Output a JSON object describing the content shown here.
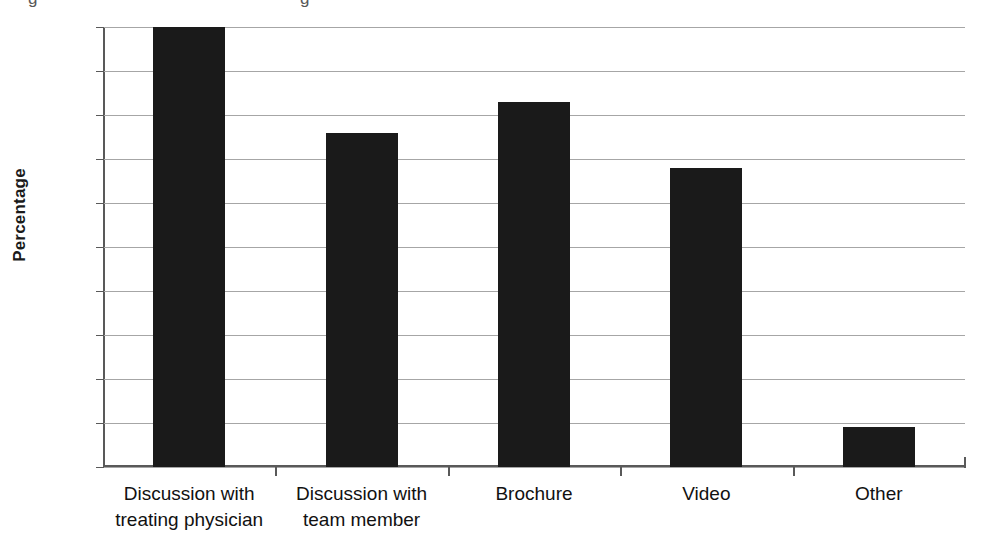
{
  "chart_data": {
    "type": "bar",
    "title": "",
    "xlabel": "",
    "ylabel": "Percentage",
    "categories": [
      "Discussion with treating physician",
      "Discussion with team member",
      "Brochure",
      "Video",
      "Other"
    ],
    "category_lines": [
      [
        "Discussion with",
        "treating physician"
      ],
      [
        "Discussion with",
        "team member"
      ],
      [
        "Brochure"
      ],
      [
        "Video"
      ],
      [
        "Other"
      ]
    ],
    "values": [
      100,
      76,
      83,
      68,
      9
    ],
    "ylim": [
      0,
      100
    ],
    "ytick_step": 10,
    "yticks": [
      0,
      10,
      20,
      30,
      40,
      50,
      60,
      70,
      80,
      90,
      100
    ],
    "ytick_labels": [
      "0",
      "10",
      "20",
      "30",
      "40",
      "50",
      "60",
      "70",
      "80",
      "90",
      "100"
    ],
    "grid": "horizontal",
    "legend": "none",
    "bar_color": "#1a1a1a",
    "gridline_color": "#a6a6a6",
    "axis_color": "#595959",
    "background_color": "#ffffff"
  },
  "scan_artifacts": {
    "top_remnant_left": "g",
    "top_remnant_right": "g"
  }
}
